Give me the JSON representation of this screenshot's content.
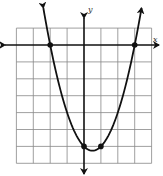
{
  "chart_data": {
    "type": "line",
    "title": "",
    "xlabel": "x",
    "ylabel": "y",
    "function": "y = x^2 - x - 6",
    "xlim": [
      -4,
      4
    ],
    "ylim": [
      -7,
      1
    ],
    "grid": true,
    "grid_step": 1,
    "axis_arrows": true,
    "tick_labels": false,
    "series": [
      {
        "name": "parabola",
        "curve": "y = (x + 2)(x - 3)",
        "marked_points": [
          {
            "x": -2,
            "y": 0
          },
          {
            "x": 3,
            "y": 0
          },
          {
            "x": 0,
            "y": -6
          },
          {
            "x": 1,
            "y": -6
          }
        ],
        "vertex": {
          "x": 0.5,
          "y": -6.25
        },
        "x_intercepts": [
          -2,
          3
        ],
        "y_intercept": -6,
        "end_arrows": true
      }
    ],
    "colors": {
      "grid": "#888888",
      "axes": "#111111",
      "curve": "#111111",
      "points": "#111111"
    }
  },
  "labels": {
    "x_axis": "x",
    "y_axis": "y"
  }
}
